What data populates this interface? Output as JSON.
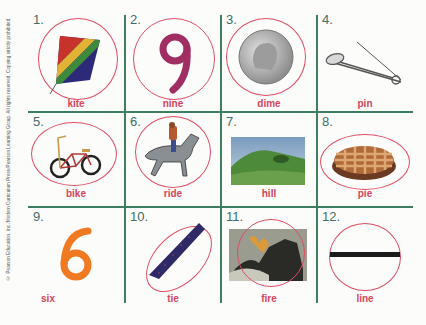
{
  "worksheet": {
    "copyright": "© Pearson Education, Inc./Modern Curriculum Press/Pearson Learning Group. All rights reserved. Copying strictly prohibited.",
    "colors": {
      "grid": "#3d7e61",
      "number": "#3f6d66",
      "word": "#d5445c",
      "circle": "#de4d63"
    },
    "items": [
      {
        "number": "1.",
        "word": "kite",
        "icon": "kite-icon",
        "circled": true
      },
      {
        "number": "2.",
        "word": "nine",
        "icon": "number-nine-icon",
        "circled": true
      },
      {
        "number": "3.",
        "word": "dime",
        "icon": "dime-coin-icon",
        "circled": true
      },
      {
        "number": "4.",
        "word": "pin",
        "icon": "safety-pin-icon",
        "circled": false
      },
      {
        "number": "5.",
        "word": "bike",
        "icon": "bicycle-icon",
        "circled": true
      },
      {
        "number": "6.",
        "word": "ride",
        "icon": "horse-rider-icon",
        "circled": true
      },
      {
        "number": "7.",
        "word": "hill",
        "icon": "hill-photo-icon",
        "circled": false
      },
      {
        "number": "8.",
        "word": "pie",
        "icon": "pie-icon",
        "circled": true
      },
      {
        "number": "9.",
        "word": "six",
        "icon": "number-six-icon",
        "circled": false
      },
      {
        "number": "10.",
        "word": "tie",
        "icon": "necktie-icon",
        "circled": true
      },
      {
        "number": "11.",
        "word": "fire",
        "icon": "fire-photo-icon",
        "circled": true
      },
      {
        "number": "12.",
        "word": "line",
        "icon": "line-icon",
        "circled": true
      }
    ]
  }
}
